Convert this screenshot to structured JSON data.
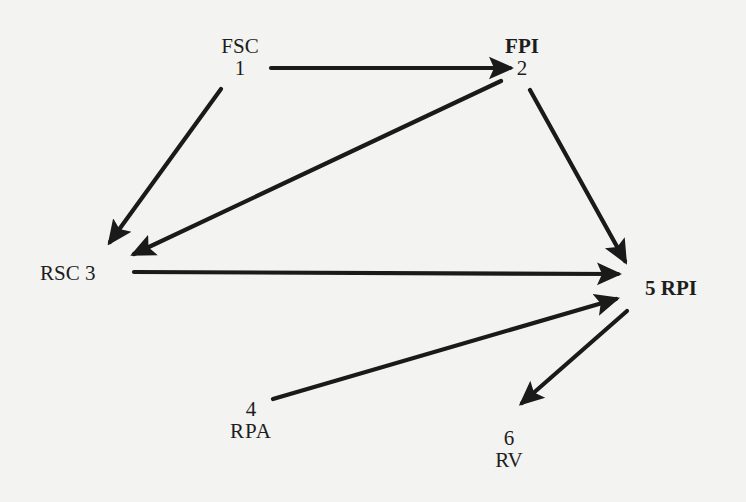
{
  "diagram": {
    "type": "directed-graph",
    "nodes": [
      {
        "id": 1,
        "name": "FSC",
        "number": "1"
      },
      {
        "id": 2,
        "name": "FPI",
        "number": "2"
      },
      {
        "id": 3,
        "name": "RSC",
        "number": "3"
      },
      {
        "id": 4,
        "name": "RPA",
        "number": "4"
      },
      {
        "id": 5,
        "name": "RPI",
        "number": "5"
      },
      {
        "id": 6,
        "name": "RV",
        "number": "6"
      }
    ],
    "edges": [
      {
        "from": 1,
        "to": 2
      },
      {
        "from": 1,
        "to": 3
      },
      {
        "from": 2,
        "to": 3
      },
      {
        "from": 2,
        "to": 5
      },
      {
        "from": 3,
        "to": 5
      },
      {
        "from": 4,
        "to": 5
      },
      {
        "from": 5,
        "to": 6
      }
    ],
    "labels": {
      "fsc": {
        "name": "FSC",
        "number": "1"
      },
      "fpi": {
        "name": "FPI",
        "number": "2"
      },
      "rsc": {
        "text": "RSC 3"
      },
      "rpa": {
        "name": "RPA",
        "number": "4"
      },
      "rpi": {
        "text": "5 RPI"
      },
      "rv": {
        "name": "RV",
        "number": "6"
      }
    },
    "colors": {
      "background": "#f3f3f1",
      "ink": "#1a1a1a"
    }
  }
}
